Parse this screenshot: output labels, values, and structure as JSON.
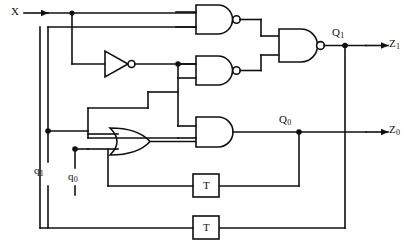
{
  "diagram": {
    "stroke_color": "#101010",
    "background_color": "#ffffff",
    "line_width": 1.6
  },
  "inputs": [
    {
      "id": "x",
      "label": "X",
      "x": 14,
      "y": 13
    }
  ],
  "outputs": [
    {
      "id": "z1",
      "label": "Z",
      "sub": "1",
      "x": 392,
      "y": 44
    },
    {
      "id": "z0",
      "label": "Z",
      "sub": "0",
      "x": 392,
      "y": 130
    }
  ],
  "state_labels": [
    {
      "id": "q1_low",
      "label": "q",
      "sub": "1",
      "x": 37,
      "y": 172
    },
    {
      "id": "q0_low",
      "label": "q",
      "sub": "0",
      "x": 70,
      "y": 178
    },
    {
      "id": "Q1",
      "label": "Q",
      "sub": "1",
      "x": 337,
      "y": 33
    },
    {
      "id": "Q0",
      "label": "Q",
      "sub": "0",
      "x": 283,
      "y": 120
    }
  ],
  "gates": [
    {
      "id": "not1",
      "type": "NOT",
      "label": "",
      "x": 105,
      "y": 52
    },
    {
      "id": "nand1",
      "type": "NAND",
      "label": "",
      "x": 196,
      "y": 5
    },
    {
      "id": "nand2",
      "type": "NAND",
      "label": "",
      "x": 196,
      "y": 56
    },
    {
      "id": "nand3",
      "type": "NAND",
      "label": "",
      "x": 279,
      "y": 29
    },
    {
      "id": "or1",
      "type": "OR",
      "label": "",
      "x": 110,
      "y": 127
    },
    {
      "id": "and1",
      "type": "AND",
      "label": "",
      "x": 196,
      "y": 117
    }
  ],
  "flipflops": [
    {
      "id": "ff0",
      "label": "T",
      "x": 193,
      "y": 174,
      "w": 26,
      "h": 23
    },
    {
      "id": "ff1",
      "label": "T",
      "x": 193,
      "y": 216,
      "w": 26,
      "h": 23
    }
  ]
}
